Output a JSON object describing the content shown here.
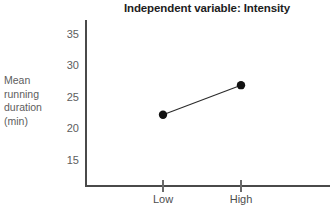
{
  "chart_data": {
    "type": "line",
    "title": "Independent variable: Intensity",
    "xlabel": "",
    "ylabel": "Mean running duration (min)",
    "ylabel_lines": [
      "Mean",
      "running",
      "duration",
      "(min)"
    ],
    "categories": [
      "Low",
      "High"
    ],
    "values": [
      22.1,
      26.8
    ],
    "series": [
      {
        "name": "Mean running duration",
        "values": [
          22.1,
          26.8
        ]
      }
    ],
    "yticks": [
      35,
      30,
      25,
      20,
      15
    ],
    "ytick_labels": [
      "35",
      "30",
      "25",
      "20",
      "15"
    ],
    "ylim": [
      11.5,
      37
    ],
    "xlim": [
      0,
      2
    ],
    "grid": false,
    "legend": false,
    "marker": "filled-circle",
    "colors": {
      "line": "#2b2b2b",
      "marker": "#121212",
      "axis": "#4a4a4a",
      "title_text": "#1d1d1d",
      "tick_text": "#5d5d5d",
      "background": "#ffffff"
    }
  },
  "axis": {
    "y_tick_label_0": "35",
    "y_tick_label_1": "30",
    "y_tick_label_2": "25",
    "y_tick_label_3": "20",
    "y_tick_label_4": "15",
    "x_tick_label_0": "Low",
    "x_tick_label_1": "High"
  },
  "ylabel_parts": {
    "line0": "Mean",
    "line1": "running",
    "line2": "duration",
    "line3": "(min)"
  }
}
